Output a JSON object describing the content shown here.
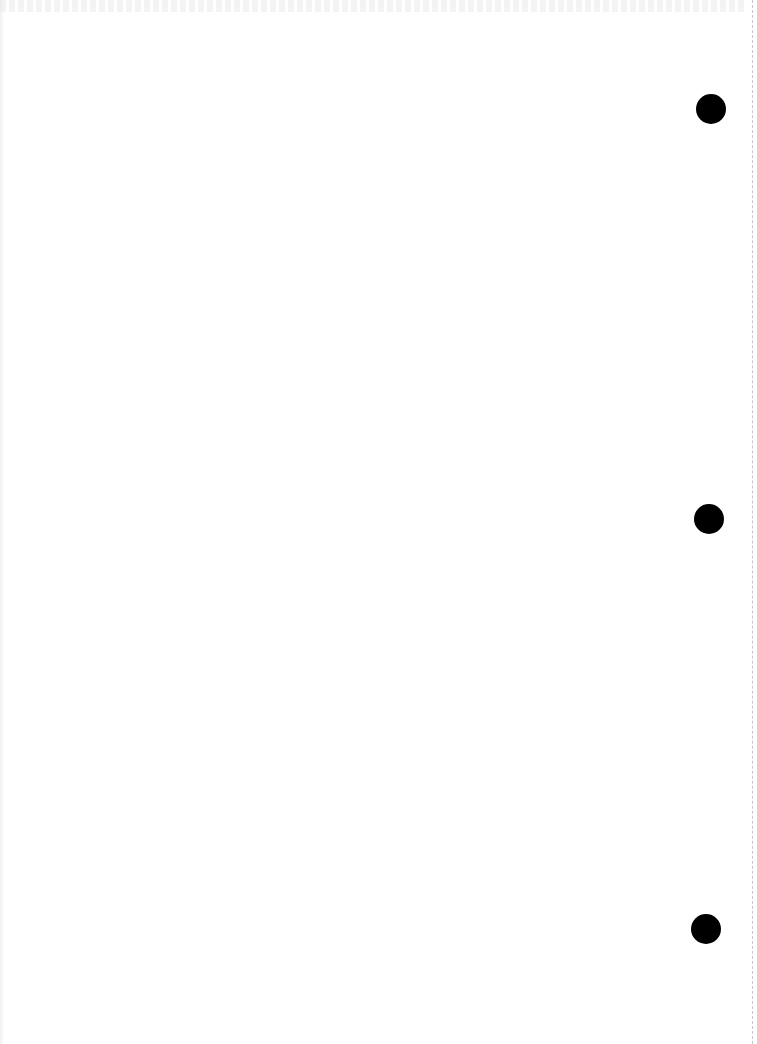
{
  "document": {
    "type": "blank scanned page",
    "background_color": "#ffffff",
    "text_content": ""
  },
  "punch_holes": [
    {
      "cx": 711,
      "cy": 109,
      "r": 15,
      "color": "#000000"
    },
    {
      "cx": 709,
      "cy": 519,
      "r": 15,
      "color": "#000000"
    },
    {
      "cx": 706,
      "cy": 929,
      "r": 15,
      "color": "#000000"
    }
  ],
  "edge_line": {
    "x": 752,
    "style": "dashed",
    "color": "#c8c8c8"
  }
}
